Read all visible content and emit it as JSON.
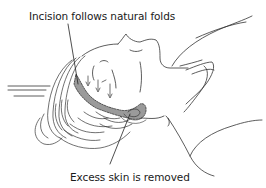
{
  "figure": {
    "labels": {
      "incision": "Incision follows natural folds",
      "excess_skin": "Excess skin is removed"
    },
    "colors": {
      "line": "#333333",
      "shaded_area": "#9a9a9a",
      "text": "#1a1a1a",
      "background": "#ffffff"
    }
  }
}
